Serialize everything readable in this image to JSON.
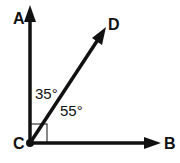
{
  "diagram": {
    "type": "geometry-angle-diagram",
    "vertex": {
      "label": "C",
      "x": 30,
      "y": 143
    },
    "rays": [
      {
        "id": "CA",
        "end_label": "A",
        "tip": [
          30,
          6
        ],
        "direction": "up"
      },
      {
        "id": "CD",
        "end_label": "D",
        "tip": [
          106,
          28
        ],
        "direction": "up-right"
      },
      {
        "id": "CB",
        "end_label": "B",
        "tip": [
          160,
          143
        ],
        "direction": "right"
      }
    ],
    "angles": [
      {
        "between": "ACD",
        "label": "35°"
      },
      {
        "between": "DCB",
        "label": "55°"
      }
    ],
    "right_angle_marker": {
      "between": "ACB"
    },
    "labels": {
      "A": "A",
      "B": "B",
      "C": "C",
      "D": "D",
      "angle_acd": "35°",
      "angle_dcb": "55°"
    },
    "colors": {
      "stroke": "#111111",
      "background": "#ffffff"
    }
  }
}
